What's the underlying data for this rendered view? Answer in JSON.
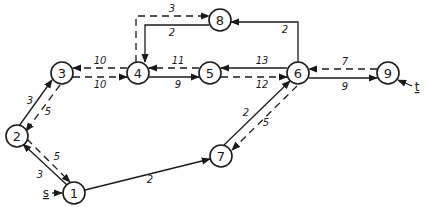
{
  "diagram": {
    "type": "flow-network-residual-graph",
    "colors": {
      "stroke": "#1a1a1a",
      "background": "#ffffff"
    },
    "source_label": "s",
    "sink_label": "t",
    "nodes": [
      {
        "id": "1",
        "label": "1"
      },
      {
        "id": "2",
        "label": "2"
      },
      {
        "id": "3",
        "label": "3"
      },
      {
        "id": "4",
        "label": "4"
      },
      {
        "id": "5",
        "label": "5"
      },
      {
        "id": "6",
        "label": "6"
      },
      {
        "id": "7",
        "label": "7"
      },
      {
        "id": "8",
        "label": "8"
      },
      {
        "id": "9",
        "label": "9"
      }
    ],
    "edges": [
      {
        "from": "1",
        "to": "2",
        "style": "solid",
        "label": "3"
      },
      {
        "from": "2",
        "to": "1",
        "style": "dashed",
        "label": "5"
      },
      {
        "from": "2",
        "to": "3",
        "style": "solid",
        "label": "3"
      },
      {
        "from": "3",
        "to": "2",
        "style": "dashed",
        "label": "5"
      },
      {
        "from": "4",
        "to": "3",
        "style": "dashed",
        "label": "10"
      },
      {
        "from": "3",
        "to": "4",
        "style": "dashed",
        "label": "10"
      },
      {
        "from": "5",
        "to": "4",
        "style": "dashed",
        "label": "11"
      },
      {
        "from": "4",
        "to": "5",
        "style": "solid",
        "label": "9"
      },
      {
        "from": "6",
        "to": "5",
        "style": "solid",
        "label": "13"
      },
      {
        "from": "5",
        "to": "6",
        "style": "dashed",
        "label": "12"
      },
      {
        "from": "9",
        "to": "6",
        "style": "dashed",
        "label": "7"
      },
      {
        "from": "6",
        "to": "9",
        "style": "solid",
        "label": "9"
      },
      {
        "from": "4",
        "to": "8",
        "style": "dashed",
        "label": "3"
      },
      {
        "from": "8",
        "to": "4",
        "style": "solid",
        "label": "2"
      },
      {
        "from": "6",
        "to": "8",
        "style": "solid",
        "label": "2"
      },
      {
        "from": "1",
        "to": "7",
        "style": "solid",
        "label": "2"
      },
      {
        "from": "7",
        "to": "6",
        "style": "solid",
        "label": "2"
      },
      {
        "from": "6",
        "to": "7",
        "style": "dashed",
        "label": "5"
      }
    ]
  }
}
